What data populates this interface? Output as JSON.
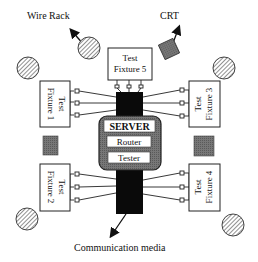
{
  "diagram": {
    "labels": {
      "wire_rack": "Wire Rack",
      "crt": "CRT",
      "communication_media": "Communication media"
    },
    "server": {
      "title": "SERVER",
      "modules": [
        "Router",
        "Tester"
      ]
    },
    "fixtures": [
      {
        "line1": "Test",
        "line2": "Fixture 1"
      },
      {
        "line1": "Test",
        "line2": "Fixture 2"
      },
      {
        "line1": "Test",
        "line2": "Fixture 3"
      },
      {
        "line1": "Test",
        "line2": "Fixture 4"
      },
      {
        "line1": "Test",
        "line2": "Fixture 5"
      }
    ],
    "colors": {
      "server_frame": "#6f6f6f",
      "bus": "#0a0a0a",
      "crt_fill": "#6a6a6a",
      "obstacle_fill": "#707070"
    }
  }
}
